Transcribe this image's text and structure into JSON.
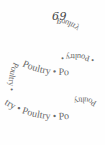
{
  "page": {
    "number": "69",
    "helix_text": {
      "word": "Poultry",
      "separator": "•",
      "back_upper": "Poultry",
      "back_left_upper": "Poultry",
      "middle_back": "• Poultry •",
      "middle_front": "Poultry • Po",
      "middle_left": "Poultry •",
      "lower_back": "Poultry",
      "lower_front": "try • Poultry • Po"
    },
    "text_color": "#666666",
    "background": "#ffffff"
  }
}
